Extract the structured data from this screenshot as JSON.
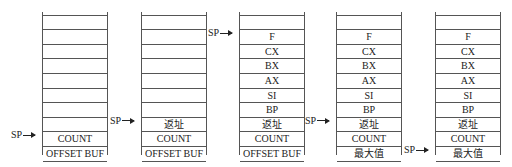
{
  "diagram": {
    "title": "",
    "pointer_label": "SP",
    "stacks": [
      {
        "left": 42,
        "sp_index": 8,
        "cells": [
          "",
          "",
          "",
          "",
          "",
          "",
          "",
          "",
          "COUNT",
          "OFFSET BUF"
        ]
      },
      {
        "left": 141,
        "sp_index": 7,
        "cells": [
          "",
          "",
          "",
          "",
          "",
          "",
          "",
          "返址",
          "COUNT",
          "OFFSET BUF"
        ]
      },
      {
        "left": 239,
        "sp_index": 1,
        "cells": [
          "",
          "F",
          "CX",
          "BX",
          "AX",
          "SI",
          "BP",
          "返址",
          "COUNT",
          "OFFSET BUF"
        ]
      },
      {
        "left": 336,
        "sp_index": 7,
        "cells": [
          "",
          "F",
          "CX",
          "BX",
          "AX",
          "SI",
          "BP",
          "返址",
          "COUNT",
          "最大值"
        ]
      },
      {
        "left": 435,
        "sp_index": 9,
        "cells": [
          "",
          "F",
          "CX",
          "BX",
          "AX",
          "SI",
          "BP",
          "返址",
          "COUNT",
          "最大值"
        ]
      }
    ]
  }
}
